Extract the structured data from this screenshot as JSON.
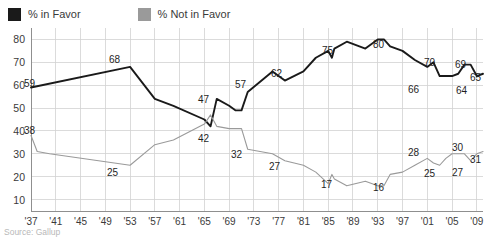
{
  "legend": {
    "entries": [
      {
        "label": "% in Favor",
        "color": "#1a1a1a",
        "icon": "square-swatch-icon"
      },
      {
        "label": "% Not in Favor",
        "color": "#9a9a9a",
        "icon": "square-swatch-icon"
      }
    ]
  },
  "source": {
    "text": "Source: Gallup"
  },
  "axis": {
    "y_ticks": [
      "80",
      "70",
      "60",
      "50",
      "40",
      "30",
      "20",
      "10"
    ],
    "x_ticks": [
      "'37",
      "'41",
      "'45",
      "'49",
      "'53",
      "'57",
      "'61",
      "'65",
      "'69",
      "'73",
      "'77",
      "'81",
      "'85",
      "'89",
      "'93",
      "'97",
      "'01",
      "'05",
      "'09"
    ]
  },
  "chart_data": {
    "type": "line",
    "title": "",
    "subtitle": "",
    "xlabel": "",
    "ylabel": "",
    "xlim": [
      1937,
      2010
    ],
    "ylim": [
      5,
      85
    ],
    "grid": true,
    "legend_position": "top-left",
    "x_tick_values": [
      1937,
      1941,
      1945,
      1949,
      1953,
      1957,
      1961,
      1965,
      1969,
      1973,
      1977,
      1981,
      1985,
      1989,
      1993,
      1997,
      2001,
      2005,
      2009
    ],
    "y_tick_values": [
      80,
      70,
      60,
      50,
      40,
      30,
      20,
      10
    ],
    "series": [
      {
        "name": "% in Favor",
        "color": "#1a1a1a",
        "x": [
          1937,
          1953,
          1957,
          1960,
          1965,
          1966,
          1967,
          1969,
          1970,
          1971,
          1972,
          1976,
          1978,
          1981,
          1983,
          1985,
          1985.6,
          1986,
          1988,
          1991,
          1993,
          1994,
          1995,
          1997,
          1999,
          2001,
          2002,
          2003,
          2004,
          2005,
          2006,
          2007,
          2008,
          2009,
          2010
        ],
        "y": [
          59,
          68,
          54,
          51,
          45,
          42,
          54,
          51,
          49,
          49,
          57,
          66,
          62,
          66,
          72,
          75,
          72,
          76,
          79,
          76,
          80,
          80,
          77,
          75,
          71,
          68,
          70,
          64,
          64,
          64,
          65,
          69,
          69,
          64,
          65
        ],
        "point_labels": [
          {
            "x": 1937,
            "y": 59,
            "text": "59"
          },
          {
            "x": 1953,
            "y": 68,
            "text": "68"
          },
          {
            "x": 1967,
            "y": 54,
            "text": "47"
          },
          {
            "x": 1972,
            "y": 57,
            "text": "57"
          },
          {
            "x": 1978,
            "y": 62,
            "text": "62"
          },
          {
            "x": 1985,
            "y": 75,
            "text": "75"
          },
          {
            "x": 1993,
            "y": 80,
            "text": "80"
          },
          {
            "x": 2001,
            "y": 68,
            "text": "66"
          },
          {
            "x": 2002,
            "y": 70,
            "text": "70"
          },
          {
            "x": 2007,
            "y": 69,
            "text": "69"
          },
          {
            "x": 2009,
            "y": 64,
            "text": "64"
          },
          {
            "x": 2010,
            "y": 65,
            "text": "65"
          }
        ]
      },
      {
        "name": "% Not in Favor",
        "color": "#9a9a9a",
        "x": [
          1937,
          1938,
          1940,
          1953,
          1957,
          1960,
          1965,
          1966,
          1967,
          1969,
          1970,
          1971,
          1972,
          1976,
          1978,
          1981,
          1983,
          1985,
          1985.6,
          1986,
          1988,
          1991,
          1993,
          1994,
          1995,
          1997,
          1999,
          2001,
          2002,
          2003,
          2004,
          2005,
          2006,
          2007,
          2008,
          2009,
          2010
        ],
        "y": [
          38,
          31,
          30,
          25,
          34,
          36,
          43,
          47,
          42,
          41,
          41,
          41,
          32,
          30,
          27,
          25,
          22,
          17,
          21,
          19,
          16,
          18,
          16,
          16,
          21,
          22,
          25,
          28,
          26,
          25,
          28,
          30,
          30,
          30,
          27,
          30,
          31
        ],
        "point_labels": [
          {
            "x": 1937,
            "y": 38,
            "text": "38"
          },
          {
            "x": 1953,
            "y": 25,
            "text": "25"
          },
          {
            "x": 1967,
            "y": 42,
            "text": "42"
          },
          {
            "x": 1972,
            "y": 32,
            "text": "32"
          },
          {
            "x": 1978,
            "y": 27,
            "text": "27"
          },
          {
            "x": 1985,
            "y": 17,
            "text": "17"
          },
          {
            "x": 1993,
            "y": 16,
            "text": "16"
          },
          {
            "x": 2001,
            "y": 28,
            "text": "28"
          },
          {
            "x": 2003,
            "y": 25,
            "text": "25"
          },
          {
            "x": 2006,
            "y": 30,
            "text": "30"
          },
          {
            "x": 2008,
            "y": 27,
            "text": "27"
          },
          {
            "x": 2010,
            "y": 31,
            "text": "31"
          }
        ]
      }
    ]
  },
  "label_placement": {
    "favor": [
      {
        "text": "59",
        "left": 24,
        "top": 79
      },
      {
        "text": "68",
        "left": 109,
        "top": 55
      },
      {
        "text": "47",
        "left": 198,
        "top": 95
      },
      {
        "text": "57",
        "left": 235,
        "top": 80
      },
      {
        "text": "62",
        "left": 271,
        "top": 69
      },
      {
        "text": "75",
        "left": 322,
        "top": 46
      },
      {
        "text": "80",
        "left": 373,
        "top": 40
      },
      {
        "text": "66",
        "left": 408,
        "top": 85
      },
      {
        "text": "70",
        "left": 424,
        "top": 58
      },
      {
        "text": "69",
        "left": 455,
        "top": 60
      },
      {
        "text": "64",
        "left": 456,
        "top": 86
      },
      {
        "text": "65",
        "left": 470,
        "top": 73
      }
    ],
    "notfavor": [
      {
        "text": "38",
        "left": 24,
        "top": 126
      },
      {
        "text": "25",
        "left": 107,
        "top": 168
      },
      {
        "text": "42",
        "left": 198,
        "top": 134
      },
      {
        "text": "32",
        "left": 231,
        "top": 150
      },
      {
        "text": "27",
        "left": 269,
        "top": 162
      },
      {
        "text": "17",
        "left": 321,
        "top": 180
      },
      {
        "text": "16",
        "left": 373,
        "top": 183
      },
      {
        "text": "28",
        "left": 408,
        "top": 148
      },
      {
        "text": "25",
        "left": 424,
        "top": 169
      },
      {
        "text": "30",
        "left": 452,
        "top": 143
      },
      {
        "text": "27",
        "left": 452,
        "top": 168
      },
      {
        "text": "31",
        "left": 470,
        "top": 155
      }
    ]
  }
}
